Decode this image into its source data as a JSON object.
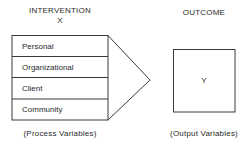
{
  "intervention": {
    "title": "INTERVENTION",
    "symbol": "X",
    "items": [
      {
        "label": "Personal"
      },
      {
        "label": "Organizational"
      },
      {
        "label": "Client"
      },
      {
        "label": "Community"
      }
    ],
    "caption": "(Process Variables)"
  },
  "outcome": {
    "title": "OUTCOME",
    "symbol": "Y",
    "caption": "(Output Variables)"
  },
  "colors": {
    "line": "#3a3a3a",
    "text": "#2a2a2a",
    "background": "#ffffff"
  }
}
